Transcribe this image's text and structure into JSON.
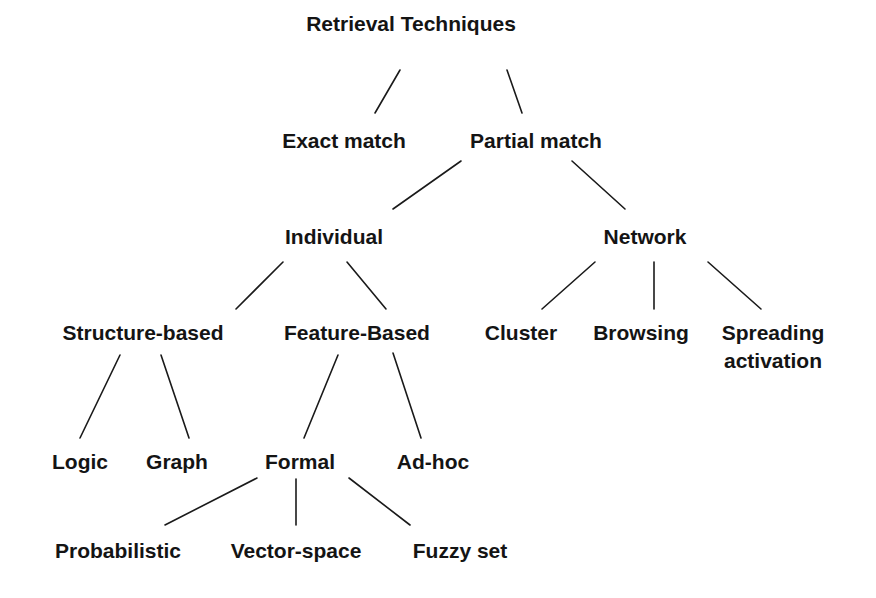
{
  "diagram": {
    "title": "Retrieval Techniques",
    "nodes": [
      {
        "id": "root",
        "lines": [
          "Retrieval Techniques"
        ],
        "x": 411,
        "y": 31
      },
      {
        "id": "exact",
        "lines": [
          "Exact match"
        ],
        "x": 344,
        "y": 148
      },
      {
        "id": "partial",
        "lines": [
          "Partial match"
        ],
        "x": 536,
        "y": 148
      },
      {
        "id": "individual",
        "lines": [
          "Individual"
        ],
        "x": 334,
        "y": 244
      },
      {
        "id": "network",
        "lines": [
          "Network"
        ],
        "x": 645,
        "y": 244
      },
      {
        "id": "structure",
        "lines": [
          "Structure-based"
        ],
        "x": 143,
        "y": 340
      },
      {
        "id": "feature",
        "lines": [
          "Feature-Based"
        ],
        "x": 357,
        "y": 340
      },
      {
        "id": "cluster",
        "lines": [
          "Cluster"
        ],
        "x": 521,
        "y": 340
      },
      {
        "id": "browsing",
        "lines": [
          "Browsing"
        ],
        "x": 641,
        "y": 340
      },
      {
        "id": "spreading",
        "lines": [
          "Spreading",
          "activation"
        ],
        "x": 773,
        "y": 340
      },
      {
        "id": "logic",
        "lines": [
          "Logic"
        ],
        "x": 80,
        "y": 469
      },
      {
        "id": "graph",
        "lines": [
          "Graph"
        ],
        "x": 177,
        "y": 469
      },
      {
        "id": "formal",
        "lines": [
          "Formal"
        ],
        "x": 300,
        "y": 469
      },
      {
        "id": "adhoc",
        "lines": [
          "Ad-hoc"
        ],
        "x": 433,
        "y": 469
      },
      {
        "id": "probabilistic",
        "lines": [
          "Probabilistic"
        ],
        "x": 118,
        "y": 558
      },
      {
        "id": "vectorspace",
        "lines": [
          "Vector-space"
        ],
        "x": 296,
        "y": 558
      },
      {
        "id": "fuzzyset",
        "lines": [
          "Fuzzy set"
        ],
        "x": 460,
        "y": 558
      }
    ],
    "edges": [
      {
        "from": "root",
        "to": "exact",
        "x1": 400,
        "y1": 70,
        "x2": 375,
        "y2": 113
      },
      {
        "from": "root",
        "to": "partial",
        "x1": 507,
        "y1": 70,
        "x2": 522,
        "y2": 113
      },
      {
        "from": "partial",
        "to": "individual",
        "x1": 461,
        "y1": 161,
        "x2": 393,
        "y2": 209
      },
      {
        "from": "partial",
        "to": "network",
        "x1": 572,
        "y1": 161,
        "x2": 625,
        "y2": 209
      },
      {
        "from": "individual",
        "to": "structure",
        "x1": 283,
        "y1": 262,
        "x2": 236,
        "y2": 309
      },
      {
        "from": "individual",
        "to": "feature",
        "x1": 347,
        "y1": 262,
        "x2": 386,
        "y2": 309
      },
      {
        "from": "network",
        "to": "cluster",
        "x1": 595,
        "y1": 262,
        "x2": 542,
        "y2": 309
      },
      {
        "from": "network",
        "to": "browsing",
        "x1": 654,
        "y1": 262,
        "x2": 654,
        "y2": 309
      },
      {
        "from": "network",
        "to": "spreading",
        "x1": 708,
        "y1": 262,
        "x2": 761,
        "y2": 309
      },
      {
        "from": "structure",
        "to": "logic",
        "x1": 120,
        "y1": 355,
        "x2": 80,
        "y2": 438
      },
      {
        "from": "structure",
        "to": "graph",
        "x1": 161,
        "y1": 355,
        "x2": 189,
        "y2": 438
      },
      {
        "from": "feature",
        "to": "formal",
        "x1": 338,
        "y1": 355,
        "x2": 304,
        "y2": 438
      },
      {
        "from": "feature",
        "to": "adhoc",
        "x1": 393,
        "y1": 353,
        "x2": 421,
        "y2": 438
      },
      {
        "from": "formal",
        "to": "probabilistic",
        "x1": 257,
        "y1": 478,
        "x2": 165,
        "y2": 525
      },
      {
        "from": "formal",
        "to": "vectorspace",
        "x1": 296,
        "y1": 479,
        "x2": 296,
        "y2": 525
      },
      {
        "from": "formal",
        "to": "fuzzyset",
        "x1": 349,
        "y1": 478,
        "x2": 410,
        "y2": 525
      }
    ]
  }
}
